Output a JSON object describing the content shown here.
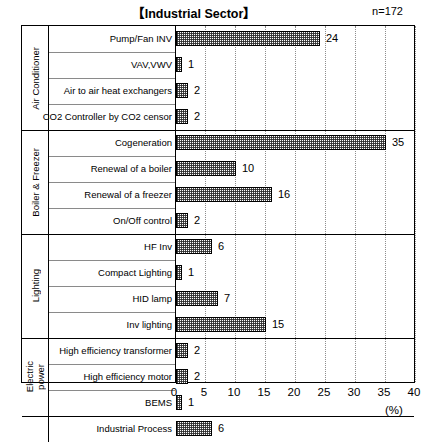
{
  "header": {
    "title": "【Industrial Sector】",
    "sample_size": "n=172"
  },
  "axis": {
    "unit_label": "(%)",
    "ticks": [
      "0",
      "5",
      "10",
      "15",
      "20",
      "25",
      "30",
      "35",
      "40"
    ]
  },
  "groups": [
    {
      "label": "Air Conditioner",
      "two_line": false
    },
    {
      "label": "Boiler & Freezer",
      "two_line": false
    },
    {
      "label": "Lighting",
      "two_line": false
    },
    {
      "label_line1": "Electric",
      "label_line2": "power",
      "two_line": true
    },
    {
      "label": "",
      "two_line": false
    }
  ],
  "rows": [
    {
      "label": "Pump/Fan INV",
      "value": 24,
      "value_text": "24"
    },
    {
      "label": "VAV,VWV",
      "value": 1,
      "value_text": "1"
    },
    {
      "label": "Air to air heat exchangers",
      "value": 2,
      "value_text": "2"
    },
    {
      "label": "CO2 Controller by CO2 censor",
      "value": 2,
      "value_text": "2"
    },
    {
      "label": "Cogeneration",
      "value": 35,
      "value_text": "35"
    },
    {
      "label": "Renewal of a boiler",
      "value": 10,
      "value_text": "10"
    },
    {
      "label": "Renewal of a freezer",
      "value": 16,
      "value_text": "16"
    },
    {
      "label": "On/Off control",
      "value": 2,
      "value_text": "2"
    },
    {
      "label": "HF Inv",
      "value": 6,
      "value_text": "6"
    },
    {
      "label": "Compact Lighting",
      "value": 1,
      "value_text": "1"
    },
    {
      "label": "HID lamp",
      "value": 7,
      "value_text": "7"
    },
    {
      "label": "Inv lighting",
      "value": 15,
      "value_text": "15"
    },
    {
      "label": "High efficiency transformer",
      "value": 2,
      "value_text": "2"
    },
    {
      "label": "High efficiency motor",
      "value": 2,
      "value_text": "2"
    },
    {
      "label": "BEMS",
      "value": 1,
      "value_text": "1"
    },
    {
      "label": "Industrial Process",
      "value": 6,
      "value_text": "6"
    }
  ],
  "chart_data": {
    "type": "bar",
    "orientation": "horizontal",
    "title": "【Industrial Sector】",
    "annotation": "n=172",
    "xlabel": "(%)",
    "ylabel": "",
    "xlim": [
      0,
      40
    ],
    "xticks": [
      0,
      5,
      10,
      15,
      20,
      25,
      30,
      35,
      40
    ],
    "grid": "vertical-dotted",
    "legend": "none",
    "categories": [
      "Pump/Fan INV",
      "VAV,VWV",
      "Air to air heat exchangers",
      "CO2 Controller by CO2 censor",
      "Cogeneration",
      "Renewal of a boiler",
      "Renewal of a freezer",
      "On/Off control",
      "HF Inv",
      "Compact Lighting",
      "HID lamp",
      "Inv lighting",
      "High efficiency transformer",
      "High efficiency motor",
      "BEMS",
      "Industrial Process"
    ],
    "values": [
      24,
      1,
      2,
      2,
      35,
      10,
      16,
      2,
      6,
      1,
      7,
      15,
      2,
      2,
      1,
      6
    ],
    "category_groups": [
      {
        "name": "Air Conditioner",
        "categories": [
          "Pump/Fan INV",
          "VAV,VWV",
          "Air to air heat exchangers",
          "CO2 Controller by CO2 censor"
        ]
      },
      {
        "name": "Boiler & Freezer",
        "categories": [
          "Cogeneration",
          "Renewal of a boiler",
          "Renewal of a freezer",
          "On/Off control"
        ]
      },
      {
        "name": "Lighting",
        "categories": [
          "HF Inv",
          "Compact Lighting",
          "HID lamp",
          "Inv lighting"
        ]
      },
      {
        "name": "Electric power",
        "categories": [
          "High efficiency transformer",
          "High efficiency motor",
          "BEMS"
        ]
      },
      {
        "name": "",
        "categories": [
          "Industrial Process"
        ]
      }
    ]
  }
}
